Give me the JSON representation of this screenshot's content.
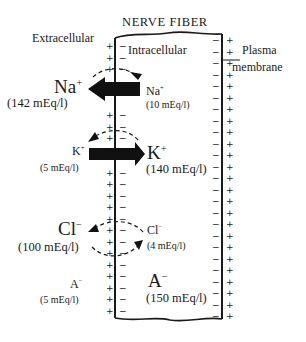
{
  "title": "NERVE FIBER",
  "labels": {
    "extracellular": "Extracellular",
    "intracellular": "Intracellular",
    "plasma_membrane_line1": "Plasma",
    "plasma_membrane_line2": "membrane"
  },
  "ions": {
    "na": {
      "symbol": "Na",
      "charge": "+",
      "extracellular_conc": "(142 mEq/l)",
      "intracellular_conc": "(10 mEq/l)",
      "net_flow": "inward (intracellular to extracellular arrow shown pointing left)",
      "pump_arrow": "dashed curved arrow from extracellular to intracellular"
    },
    "k": {
      "symbol": "K",
      "charge": "+",
      "extracellular_conc": "(5 mEq/l)",
      "intracellular_conc": "(140 mEq/l)",
      "net_flow": "arrow pointing right (toward intracellular)",
      "pump_arrow": "dashed curved arrow from intracellular to extracellular"
    },
    "cl": {
      "symbol": "Cl",
      "charge": "−",
      "extracellular_conc": "(100 mEq/l)",
      "intracellular_conc": "(4 mEq/l)",
      "arrows": "two dashed curved arrows (exchange across membrane)"
    },
    "a": {
      "symbol": "A",
      "charge": "−",
      "extracellular_conc": "(5 mEq/l)",
      "intracellular_conc": "(150 mEq/l)"
    }
  },
  "membrane_charges": {
    "outer_side": "+",
    "inner_side": "−"
  },
  "colors": {
    "ink": "#1a1a1a",
    "background": "#ffffff",
    "faint_text": "#555555"
  }
}
